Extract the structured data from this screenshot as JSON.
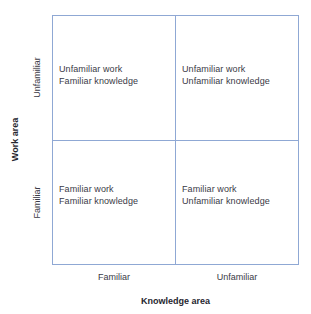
{
  "chart_data": {
    "type": "table",
    "title": "",
    "xlabel": "Knowledge area",
    "ylabel": "Work area",
    "x_categories": [
      "Familiar",
      "Unfamiliar"
    ],
    "y_categories": [
      "Familiar",
      "Unfamiliar"
    ],
    "grid": true,
    "legend": "none",
    "line_color": "#8fa8d4",
    "text_color": "#3a3a46",
    "background": "#ffffff",
    "cells": [
      {
        "id": "top-left",
        "work_area": "Unfamiliar",
        "knowledge_area": "Familiar",
        "lines": [
          "Unfamiliar work",
          "Familiar knowledge"
        ]
      },
      {
        "id": "top-right",
        "work_area": "Unfamiliar",
        "knowledge_area": "Unfamiliar",
        "lines": [
          "Unfamiliar work",
          "Unfamiliar knowledge"
        ]
      },
      {
        "id": "bottom-left",
        "work_area": "Familiar",
        "knowledge_area": "Familiar",
        "lines": [
          "Familiar work",
          "Familiar knowledge"
        ]
      },
      {
        "id": "bottom-right",
        "work_area": "Familiar",
        "knowledge_area": "Unfamiliar",
        "lines": [
          "Familiar work",
          "Unfamiliar knowledge"
        ]
      }
    ]
  },
  "axes": {
    "y": {
      "title": "Work area",
      "ticks": {
        "upper": "Unfamiliar",
        "lower": "Familiar"
      }
    },
    "x": {
      "title": "Knowledge area",
      "ticks": {
        "left": "Familiar",
        "right": "Unfamiliar"
      }
    }
  },
  "quadrants": {
    "top_left": {
      "line1": "Unfamiliar work",
      "line2": "Familiar knowledge"
    },
    "top_right": {
      "line1": "Unfamiliar work",
      "line2": "Unfamiliar knowledge"
    },
    "bottom_left": {
      "line1": "Familiar work",
      "line2": "Familiar knowledge"
    },
    "bottom_right": {
      "line1": "Familiar work",
      "line2": "Unfamiliar knowledge"
    }
  },
  "colors": {
    "line": "#8fa8d4",
    "text": "#3a3a46",
    "title_text": "#26262f",
    "background": "#ffffff"
  }
}
